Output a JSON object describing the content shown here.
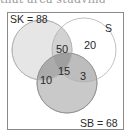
{
  "top_fragment": "that area studying",
  "diagram": {
    "type": "venn-3",
    "sets": [
      {
        "id": "SK",
        "label": "SK = 88",
        "total": 88,
        "fill": "#e6e6e6",
        "stroke": "#b8b8b8"
      },
      {
        "id": "S",
        "label": "S",
        "fill": "#ffffff",
        "stroke": "#b8b8b8"
      },
      {
        "id": "SB",
        "label": "SB = 68",
        "total": 68,
        "fill": "#c9c9c9",
        "stroke": "#9c9c9c"
      }
    ],
    "regions": {
      "SK_and_S_only": "50",
      "S_only": "20",
      "SK_and_SB_only": "10",
      "SK_and_S_and_SB": "15",
      "S_and_SB_only": "3"
    },
    "colors": {
      "frame": "#8a8a8a",
      "text": "#2a2a2a",
      "triple_overlap": "#9f9f9f",
      "sk_sb_overlap": "#ababab",
      "s_sb_overlap": "#bdbdbd",
      "sk_s_overlap": "#d2d2d2"
    }
  }
}
